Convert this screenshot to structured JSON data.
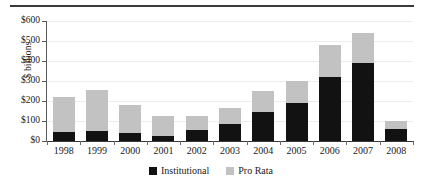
{
  "chart_data": {
    "type": "bar",
    "title": "",
    "xlabel": "",
    "ylabel": "$ billions",
    "categories": [
      "1998",
      "1999",
      "2000",
      "2001",
      "2002",
      "2003",
      "2004",
      "2005",
      "2006",
      "2007",
      "2008"
    ],
    "series": [
      {
        "name": "Institutional",
        "color": "#121212",
        "values": [
          45,
          50,
          40,
          25,
          55,
          85,
          145,
          190,
          320,
          390,
          60
        ]
      },
      {
        "name": "Pro Rata",
        "color": "#c2c2c2",
        "values": [
          175,
          205,
          140,
          100,
          70,
          80,
          105,
          110,
          160,
          150,
          40
        ]
      }
    ],
    "totals": [
      220,
      255,
      180,
      125,
      125,
      165,
      250,
      300,
      480,
      540,
      100
    ],
    "stacked": true,
    "ylim": [
      0,
      600
    ],
    "yticks": [
      0,
      100,
      200,
      300,
      400,
      500,
      600
    ],
    "ytick_labels": [
      "$0",
      "$100",
      "$200",
      "$300",
      "$400",
      "$500",
      "$600"
    ],
    "grid": true,
    "legend_position": "bottom"
  },
  "legend": {
    "items": [
      {
        "label": "Institutional",
        "swatch": "black-square-icon"
      },
      {
        "label": "Pro Rata",
        "swatch": "gray-square-icon"
      }
    ]
  }
}
